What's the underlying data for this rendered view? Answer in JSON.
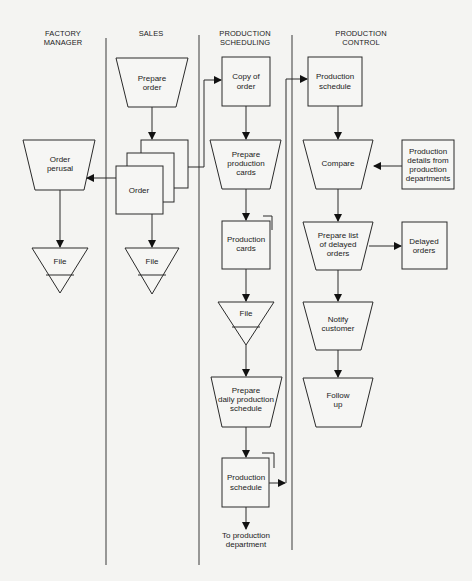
{
  "lanes": [
    {
      "id": "factory-manager",
      "header": [
        "FACTORY",
        "MANAGER"
      ]
    },
    {
      "id": "sales",
      "header": [
        "SALES"
      ]
    },
    {
      "id": "production-scheduling",
      "header": [
        "PRODUCTION",
        "SCHEDULING"
      ]
    },
    {
      "id": "production-control",
      "header": [
        "PRODUCTION",
        "CONTROL"
      ]
    }
  ],
  "nodes": {
    "prepare_order": {
      "type": "manual-operation",
      "lines": [
        "Prepare",
        "order"
      ]
    },
    "order": {
      "type": "multi-document",
      "lines": [
        "Order"
      ]
    },
    "order_perusal": {
      "type": "manual-operation",
      "lines": [
        "Order",
        "perusal"
      ]
    },
    "fm_file": {
      "type": "file",
      "lines": [
        "File"
      ]
    },
    "sales_file": {
      "type": "file",
      "lines": [
        "File"
      ]
    },
    "copy_of_order": {
      "type": "document",
      "lines": [
        "Copy of",
        "order"
      ]
    },
    "prepare_production_cards": {
      "type": "manual-operation",
      "lines": [
        "Prepare",
        "production",
        "cards"
      ]
    },
    "production_cards": {
      "type": "document",
      "lines": [
        "Production",
        "cards"
      ]
    },
    "ps_file": {
      "type": "file",
      "lines": [
        "File"
      ]
    },
    "prepare_daily_schedule": {
      "type": "manual-operation",
      "lines": [
        "Prepare",
        "daily production",
        "schedule"
      ]
    },
    "ps_production_schedule": {
      "type": "document",
      "lines": [
        "Production",
        "schedule"
      ]
    },
    "to_production_department": {
      "type": "terminal-text",
      "lines": [
        "To production",
        "department"
      ]
    },
    "pc_production_schedule": {
      "type": "document",
      "lines": [
        "Production",
        "schedule"
      ]
    },
    "compare": {
      "type": "manual-operation",
      "lines": [
        "Compare"
      ]
    },
    "production_details": {
      "type": "document",
      "lines": [
        "Production",
        "details from",
        "production",
        "departments"
      ]
    },
    "prepare_delayed_list": {
      "type": "manual-operation",
      "lines": [
        "Prepare list",
        "of delayed",
        "orders"
      ]
    },
    "delayed_orders": {
      "type": "document",
      "lines": [
        "Delayed",
        "orders"
      ]
    },
    "notify_customer": {
      "type": "manual-operation",
      "lines": [
        "Notify",
        "customer"
      ]
    },
    "follow_up": {
      "type": "manual-operation",
      "lines": [
        "Follow",
        "up"
      ]
    }
  },
  "edges": [
    {
      "from": "prepare_order",
      "to": "order"
    },
    {
      "from": "order",
      "to": "order_perusal"
    },
    {
      "from": "order",
      "to": "sales_file"
    },
    {
      "from": "order",
      "to": "copy_of_order"
    },
    {
      "from": "order_perusal",
      "to": "fm_file"
    },
    {
      "from": "copy_of_order",
      "to": "prepare_production_cards"
    },
    {
      "from": "prepare_production_cards",
      "to": "production_cards"
    },
    {
      "from": "production_cards",
      "to": "ps_file"
    },
    {
      "from": "ps_file",
      "to": "prepare_daily_schedule"
    },
    {
      "from": "prepare_daily_schedule",
      "to": "ps_production_schedule"
    },
    {
      "from": "ps_production_schedule",
      "to": "to_production_department"
    },
    {
      "from": "ps_production_schedule",
      "to": "pc_production_schedule"
    },
    {
      "from": "pc_production_schedule",
      "to": "compare"
    },
    {
      "from": "production_details",
      "to": "compare"
    },
    {
      "from": "compare",
      "to": "prepare_delayed_list"
    },
    {
      "from": "prepare_delayed_list",
      "to": "delayed_orders"
    },
    {
      "from": "prepare_delayed_list",
      "to": "notify_customer"
    },
    {
      "from": "notify_customer",
      "to": "follow_up"
    }
  ]
}
